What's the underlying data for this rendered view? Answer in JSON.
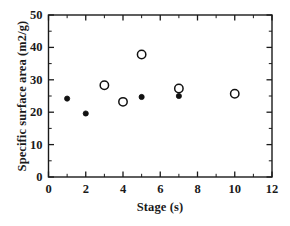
{
  "chart_data": {
    "type": "scatter",
    "title": "",
    "xlabel": "Stage (s)",
    "ylabel": "Specific surface area (m2/g)",
    "xlim": [
      0,
      12
    ],
    "ylim": [
      0,
      50
    ],
    "xticks": [
      0,
      2,
      4,
      6,
      8,
      10,
      12
    ],
    "yticks": [
      0,
      10,
      20,
      30,
      40,
      50
    ],
    "xtick_labels": [
      "0",
      "2",
      "4",
      "6",
      "8",
      "10",
      "12"
    ],
    "ytick_labels": [
      "0",
      "10",
      "20",
      "30",
      "40",
      "50"
    ],
    "x_minor_step": 1,
    "y_minor_step": 5,
    "grid": false,
    "legend": null,
    "frame": "box",
    "series": [
      {
        "name": "open-circles",
        "marker": "open-circle",
        "color": "#111111",
        "points": [
          {
            "x": 3,
            "y": 28.3
          },
          {
            "x": 4,
            "y": 23.2
          },
          {
            "x": 5,
            "y": 37.8
          },
          {
            "x": 7,
            "y": 27.3
          },
          {
            "x": 10,
            "y": 25.7
          }
        ]
      },
      {
        "name": "filled-circles",
        "marker": "filled-circle",
        "color": "#111111",
        "points": [
          {
            "x": 1,
            "y": 24.2
          },
          {
            "x": 2,
            "y": 19.6
          },
          {
            "x": 5,
            "y": 24.7
          },
          {
            "x": 7,
            "y": 25.0
          }
        ]
      }
    ]
  },
  "axes": {
    "x_title": "Stage (s)",
    "y_title": "Specific surface area (m2/g)"
  }
}
